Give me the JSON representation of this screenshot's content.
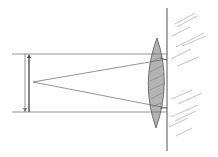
{
  "diagram": {
    "title": "",
    "colors": {
      "line": "#555555",
      "lens_fill": "#b0b0b0",
      "hatch": "#9a9a9a",
      "background": "#ffffff"
    },
    "elements": [
      "wall",
      "lens",
      "object-arrow",
      "converging-rays",
      "horizontal-guides",
      "wall-hatching"
    ]
  }
}
